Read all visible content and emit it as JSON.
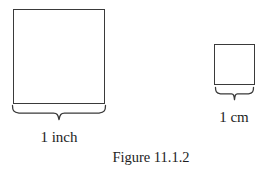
{
  "figure": {
    "caption": "Figure 11.1.2",
    "background_color": "#ffffff",
    "stroke_color": "#3a3a3a",
    "text_color": "#1d1d1d",
    "shapes": [
      {
        "id": "inch-square",
        "kind": "square",
        "label": "1 inch",
        "unit": "inch",
        "magnitude": 1,
        "width_px": 92,
        "height_px": 95
      },
      {
        "id": "cm-square",
        "kind": "square",
        "label": "1 cm",
        "unit": "cm",
        "magnitude": 1,
        "width_px": 41,
        "height_px": 41
      }
    ],
    "annotations": [
      {
        "id": "inch-brace",
        "kind": "curly-brace",
        "orientation": "down",
        "measures": "inch-square"
      },
      {
        "id": "cm-brace",
        "kind": "curly-brace",
        "orientation": "down",
        "measures": "cm-square"
      }
    ]
  }
}
